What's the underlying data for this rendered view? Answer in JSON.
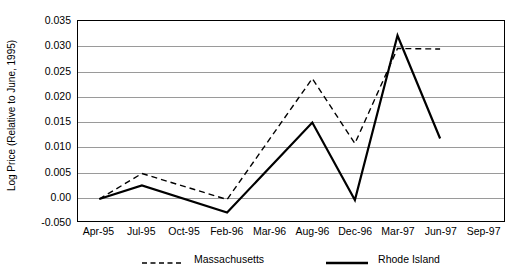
{
  "chart_data": {
    "type": "line",
    "title": "",
    "xlabel": "",
    "ylabel": "Log Price (Relative to June, 1995)",
    "grid": true,
    "legend_position": "bottom",
    "x": [
      "Apr-95",
      "Jul-95",
      "Oct-95",
      "Feb-96",
      "Mar-96",
      "Aug-96",
      "Dec-96",
      "Mar-97",
      "Jun-97",
      "Sep-97"
    ],
    "categories": [
      "Apr-95",
      "Jul-95",
      "Oct-95",
      "Feb-96",
      "Mar-96",
      "Aug-96",
      "Dec-96",
      "Mar-97",
      "Jun-97",
      "Sep-97"
    ],
    "xtick_labels": [
      "Apr-95",
      "Jul-95",
      "Oct-95",
      "Feb-96",
      "Mar-96",
      "Aug-96",
      "Dec-96",
      "Mar-97",
      "Jun-97",
      "Sep-97"
    ],
    "ytick_labels": [
      "0.035",
      "0.030",
      "0.025",
      "0.020",
      "0.015",
      "0.010",
      "0.005",
      "0.00",
      "-0.050"
    ],
    "ytick_values": [
      0.035,
      0.03,
      0.025,
      0.02,
      0.015,
      0.01,
      0.005,
      0.0,
      -0.005
    ],
    "ylim": [
      -0.005,
      0.035
    ],
    "series": [
      {
        "name": "Massachusetts",
        "style": "dashed",
        "color": "#000000",
        "points": [
          {
            "x": "Apr-95",
            "y": -0.0006
          },
          {
            "x": "Jul-95",
            "y": 0.0045
          },
          {
            "x": "Feb-96",
            "y": -0.0007
          },
          {
            "x": "Aug-96",
            "y": 0.0235
          },
          {
            "x": "Dec-96",
            "y": 0.0105
          },
          {
            "x": "Mar-97",
            "y": 0.0295
          },
          {
            "x": "Jun-97",
            "y": 0.0294
          }
        ],
        "values": [
          -0.0006,
          0.0045,
          null,
          -0.0007,
          null,
          0.0235,
          0.0105,
          0.0295,
          0.0294,
          null
        ]
      },
      {
        "name": "Rhode Island",
        "style": "solid",
        "color": "#000000",
        "points": [
          {
            "x": "Apr-95",
            "y": -0.0006
          },
          {
            "x": "Jul-95",
            "y": 0.0021
          },
          {
            "x": "Feb-96",
            "y": -0.0033
          },
          {
            "x": "Aug-96",
            "y": 0.0147
          },
          {
            "x": "Dec-96",
            "y": -0.0008
          },
          {
            "x": "Mar-97",
            "y": 0.0321
          },
          {
            "x": "Jun-97",
            "y": 0.0115
          }
        ],
        "values": [
          -0.0006,
          0.0021,
          null,
          -0.0033,
          null,
          0.0147,
          -0.0008,
          0.0321,
          0.0115,
          null
        ]
      }
    ]
  },
  "legend": {
    "entries": [
      {
        "label": "Massachusetts",
        "style": "dashed"
      },
      {
        "label": "Rhode Island",
        "style": "solid"
      }
    ]
  }
}
